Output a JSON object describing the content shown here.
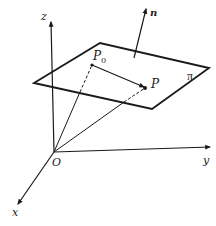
{
  "diagram": {
    "title": "",
    "type": "3D coordinate system with plane and normal vector",
    "colors": {
      "stroke": "#1a1a1a",
      "background": "#ffffff"
    },
    "axes": {
      "origin_label": "O",
      "x_label": "x",
      "y_label": "y",
      "z_label": "z"
    },
    "plane": {
      "label": "π"
    },
    "normal": {
      "label": "n"
    },
    "points": {
      "p0_main": "P",
      "p0_sub": "0",
      "p": "P"
    }
  }
}
